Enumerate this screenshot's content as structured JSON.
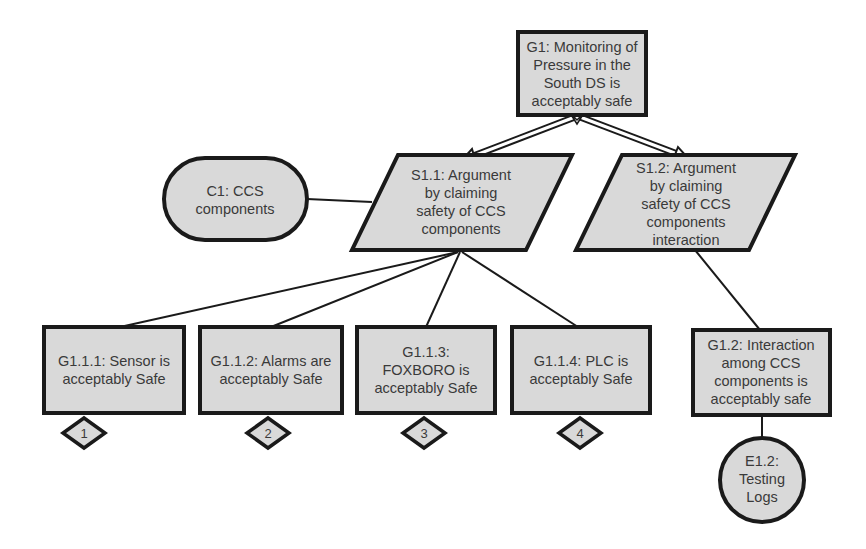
{
  "colors": {
    "node_fill": "#d9d9d9",
    "stroke": "#1a1a1a",
    "text": "#3a3a3a",
    "background": "#ffffff"
  },
  "nodes": {
    "g1": {
      "id": "G1",
      "type": "goal",
      "lines": [
        "G1: Monitoring of",
        "Pressure in the",
        "South DS is",
        "acceptably safe"
      ]
    },
    "s1_1": {
      "id": "S1.1",
      "type": "strategy",
      "lines": [
        "S1.1: Argument",
        "by claiming",
        "safety of CCS",
        "components"
      ]
    },
    "s1_2": {
      "id": "S1.2",
      "type": "strategy",
      "lines": [
        "S1.2: Argument",
        "by claiming",
        "safety of CCS",
        "components",
        "interaction"
      ]
    },
    "c1": {
      "id": "C1",
      "type": "context",
      "lines": [
        "C1: CCS",
        "components"
      ]
    },
    "g1_1_1": {
      "id": "G1.1.1",
      "type": "goal",
      "lines": [
        "G1.1.1: Sensor is",
        "acceptably Safe"
      ],
      "undeveloped_label": "1"
    },
    "g1_1_2": {
      "id": "G1.1.2",
      "type": "goal",
      "lines": [
        "G1.1.2: Alarms are",
        "acceptably Safe"
      ],
      "undeveloped_label": "2"
    },
    "g1_1_3": {
      "id": "G1.1.3",
      "type": "goal",
      "lines": [
        "G1.1.3:",
        "FOXBORO is",
        "acceptably Safe"
      ],
      "undeveloped_label": "3"
    },
    "g1_1_4": {
      "id": "G1.1.4",
      "type": "goal",
      "lines": [
        "G1.1.4: PLC is",
        "acceptably Safe"
      ],
      "undeveloped_label": "4"
    },
    "g1_2": {
      "id": "G1.2",
      "type": "goal",
      "lines": [
        "G1.2: Interaction",
        "among CCS",
        "components is",
        "acceptably safe"
      ]
    },
    "e1_2": {
      "id": "E1.2",
      "type": "evidence",
      "lines": [
        "E1.2:",
        "Testing",
        "Logs"
      ]
    }
  },
  "edges": [
    {
      "from": "S1.1",
      "to": "G1",
      "kind": "supported-by"
    },
    {
      "from": "S1.2",
      "to": "G1",
      "kind": "supported-by"
    },
    {
      "from": "C1",
      "to": "S1.1",
      "kind": "in-context-of"
    },
    {
      "from": "S1.1",
      "to": "G1.1.1",
      "kind": "line"
    },
    {
      "from": "S1.1",
      "to": "G1.1.2",
      "kind": "line"
    },
    {
      "from": "S1.1",
      "to": "G1.1.3",
      "kind": "line"
    },
    {
      "from": "S1.1",
      "to": "G1.1.4",
      "kind": "line"
    },
    {
      "from": "S1.2",
      "to": "G1.2",
      "kind": "line"
    },
    {
      "from": "G1.2",
      "to": "E1.2",
      "kind": "line"
    }
  ]
}
